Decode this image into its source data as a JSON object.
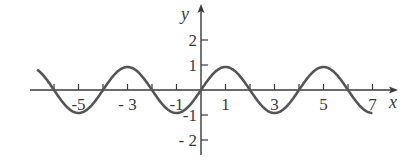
{
  "chart_data": {
    "type": "line",
    "title": "",
    "function": "y = sin(pi*x/2)",
    "xlabel": "x",
    "ylabel": "y",
    "xlim": [
      -6.65,
      6.95
    ],
    "ylim": [
      -2,
      2
    ],
    "x_ticks": [
      -5,
      -3,
      -1,
      1,
      3,
      5,
      7
    ],
    "x_tick_labels": [
      "-5",
      "- 3",
      "-1",
      "1",
      "3",
      "5",
      "7"
    ],
    "x_minor_ticks": [
      -6,
      -4,
      -2,
      0,
      2,
      4,
      6
    ],
    "y_ticks": [
      2,
      1,
      -1,
      -2
    ],
    "y_tick_labels": [
      "2",
      "1",
      "-1",
      "- 2"
    ],
    "grid": false,
    "legend": null,
    "series": [
      {
        "name": "sine curve",
        "amplitude": 1,
        "period": 4,
        "x": [
          -6.65,
          -6,
          -5,
          -4,
          -3,
          -2,
          -1,
          0,
          1,
          2,
          3,
          4,
          5,
          6,
          6.95
        ],
        "values": [
          0.86,
          0,
          -1,
          0,
          1,
          0,
          -1,
          0,
          1,
          0,
          -1,
          0,
          1,
          0,
          -1.0
        ]
      }
    ],
    "colors": {
      "curve": "#555555",
      "axes": "#3a3a3a"
    }
  },
  "layout": {
    "origin_px": [
      201,
      90
    ],
    "x_unit_px": 24.5,
    "y_unit_px": 25
  }
}
